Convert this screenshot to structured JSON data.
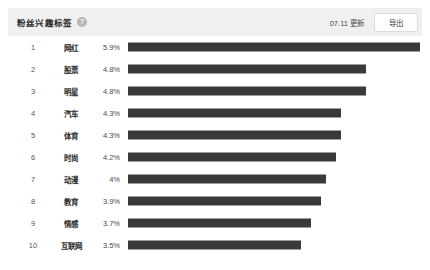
{
  "header": {
    "title": "粉丝兴趣标签",
    "help_icon": "question-mark-circle-icon",
    "update_text": "07.11 更新",
    "export_label": "导出"
  },
  "chart_data": {
    "type": "bar",
    "title": "粉丝兴趣标签",
    "xlabel": "",
    "ylabel": "",
    "orientation": "horizontal",
    "grid": false,
    "legend": false,
    "bar_color": "#3a3a3a",
    "axis_max_percent": 5.9,
    "categories": [
      "网红",
      "股票",
      "明星",
      "汽车",
      "体育",
      "时尚",
      "动漫",
      "教育",
      "情感",
      "互联网"
    ],
    "values": [
      5.9,
      4.8,
      4.8,
      4.3,
      4.3,
      4.2,
      4.0,
      3.9,
      3.7,
      3.5
    ],
    "value_labels": [
      "5.9%",
      "4.8%",
      "4.8%",
      "4.3%",
      "4.3%",
      "4.2%",
      "4%",
      "3.9%",
      "3.7%",
      "3.5%"
    ],
    "ranks": [
      "1",
      "2",
      "3",
      "4",
      "5",
      "6",
      "7",
      "8",
      "9",
      "10"
    ]
  }
}
